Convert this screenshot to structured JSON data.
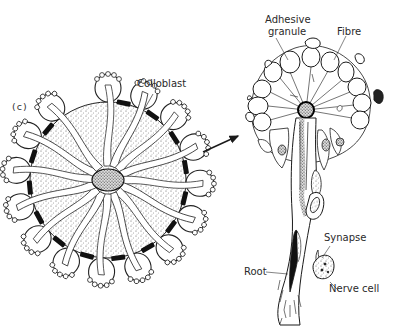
{
  "figure": {
    "panel_label": "(c)",
    "left_panel": {
      "description": "Cross-section of tentacle rosette covered with colloblasts",
      "labels": [
        {
          "id": "colloblast",
          "text": "Colloblast"
        }
      ]
    },
    "right_panel": {
      "description": "Enlarged single colloblast cell",
      "labels": [
        {
          "id": "adhesive_granule",
          "text": "Adhesive granule",
          "lines": [
            "Adhesive",
            "granule"
          ]
        },
        {
          "id": "fibre",
          "text": "Fibre"
        },
        {
          "id": "synapse",
          "text": "Synapse"
        },
        {
          "id": "root",
          "text": "Root"
        },
        {
          "id": "nerve_cell",
          "text": "Nerve cell"
        }
      ]
    },
    "arrow": "left-to-right magnification arrow",
    "colors": {
      "ink": "#1a1a1a",
      "background": "#ffffff",
      "label_text": "#2a2a2a"
    }
  }
}
